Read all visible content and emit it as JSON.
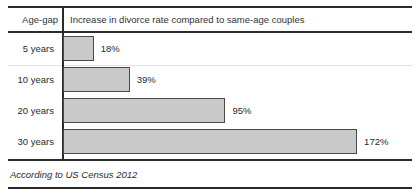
{
  "table": {
    "header": {
      "category_label": "Age-gap",
      "measure_label": "Increase in divorce rate compared to same-age couples"
    },
    "footnote": "According to US Census 2012"
  },
  "style": {
    "bar_fill": "#c9c9c9",
    "bar_border": "#4a4a4a",
    "rule_color": "#2b2b2b",
    "text_color": "#2b2b2b",
    "background": "#ffffff"
  },
  "chart_data": {
    "type": "bar",
    "orientation": "horizontal",
    "title": "Increase in divorce rate compared to same-age couples",
    "xlabel": "Increase in divorce rate compared to same-age couples",
    "ylabel": "Age-gap",
    "categories": [
      "5 years",
      "10 years",
      "20 years",
      "30 years"
    ],
    "values": [
      18,
      39,
      95,
      172
    ],
    "value_labels": [
      "18%",
      "39%",
      "95%",
      "172%"
    ],
    "unit": "%",
    "xlim": [
      0,
      172
    ],
    "grid": false,
    "legend": false,
    "annotation": "According to US Census 2012",
    "px_per_unit": 1.71
  }
}
